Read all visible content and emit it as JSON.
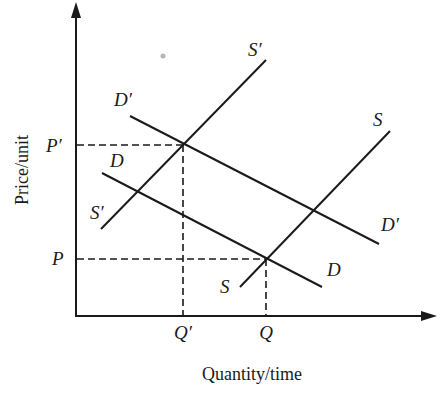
{
  "diagram": {
    "type": "supply-demand-shift",
    "axes": {
      "x_label": "Quantity/time",
      "y_label": "Price/unit"
    },
    "price_labels": {
      "initial": "P",
      "new": "P′"
    },
    "quantity_labels": {
      "initial": "Q",
      "new": "Q′"
    },
    "curves": [
      {
        "id": "D",
        "label": "D",
        "kind": "demand",
        "role": "initial"
      },
      {
        "id": "Dp",
        "label": "D′",
        "kind": "demand",
        "role": "shifted"
      },
      {
        "id": "S",
        "label": "S",
        "kind": "supply",
        "role": "initial"
      },
      {
        "id": "Sp",
        "label": "S′",
        "kind": "supply",
        "role": "shifted"
      }
    ],
    "curve_labels": {
      "D_left": "D",
      "D_right": "D",
      "Dp_left": "D′",
      "Dp_right": "D′",
      "S_top": "S",
      "S_bottom": "S",
      "Sp_top": "S′",
      "Sp_bottom": "S′"
    },
    "equilibria": [
      {
        "price": "P",
        "quantity": "Q",
        "curves": [
          "S",
          "D"
        ]
      },
      {
        "price": "P′",
        "quantity": "Q′",
        "curves": [
          "S′",
          "D′"
        ]
      }
    ],
    "colors": {
      "ink": "#1a1a1a",
      "background": "#ffffff",
      "artifact": "#b5b5b5"
    }
  }
}
